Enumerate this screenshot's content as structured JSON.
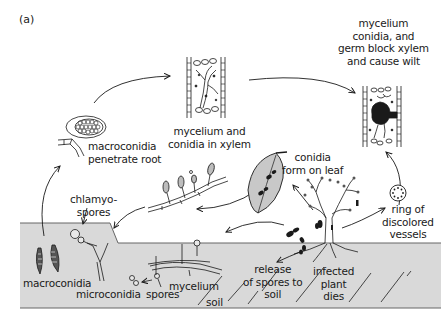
{
  "figure": {
    "panel_label": "(a)",
    "colors": {
      "background": "#ffffff",
      "soil": "#d9d9d9",
      "soil_edge": "#555555",
      "ink": "#1a1a1a"
    }
  },
  "labels": {
    "macroconidia_penetrate": [
      "macroconidia",
      "penetrate root"
    ],
    "mycelium_xylem": [
      "mycelium and",
      "conidia in xylem"
    ],
    "block_xylem": [
      "mycelium",
      "conidia, and",
      "germ block xylem",
      "and cause wilt"
    ],
    "conidia_leaf": [
      "conidia",
      "form on leaf"
    ],
    "ring": [
      "ring of",
      "discolored",
      "vessels"
    ],
    "chlamyospores": [
      "chlamyo-",
      "spores"
    ],
    "macroconidia": "macroconidia",
    "microconidia": "microconidia",
    "spores": "spores",
    "mycelium": "mycelium",
    "soil": "soil",
    "release": [
      "release",
      "of spores to",
      "soil"
    ],
    "infected": [
      "infected",
      "plant",
      "dies"
    ]
  }
}
